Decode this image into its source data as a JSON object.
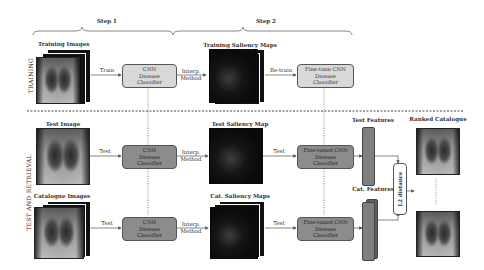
{
  "steps": {
    "step1": "Step 1",
    "step2": "Step 2"
  },
  "sections": {
    "training": "TRAINING",
    "test_retrieval": "TEST AND RETRIEVAL"
  },
  "training_row": {
    "images_label": "Training Images",
    "train_edge": "Train",
    "classifier": [
      "CNN",
      "Disease",
      "Classifier"
    ],
    "interp_edge": [
      "Interp.",
      "Method"
    ],
    "saliency_label": "Training Saliency Maps",
    "retrain_edge": "Re-train",
    "finetune": [
      "Fine-tune CNN",
      "Disease",
      "Classifier"
    ]
  },
  "test_row": {
    "image_label": "Test Image",
    "test_edge": "Test",
    "classifier": [
      "CNN",
      "Disease",
      "Classifier"
    ],
    "interp_edge": [
      "Interp.",
      "Method"
    ],
    "saliency_label": "Test Saliency Map",
    "test_edge2": "Test",
    "finetuned": [
      "Fine-tuned CNN",
      "Disease",
      "Classifier"
    ],
    "features_label": "Test Features"
  },
  "catalogue_row": {
    "images_label": "Catalogue Images",
    "test_edge": "Test",
    "classifier": [
      "CNN",
      "Disease",
      "Classifier"
    ],
    "interp_edge": [
      "Interp.",
      "Method"
    ],
    "saliency_label": "Cat. Saliency Maps",
    "test_edge2": "Test",
    "finetuned": [
      "Fine-tuned CNN",
      "Disease",
      "Classifier"
    ],
    "features_label": "Cat. Features"
  },
  "distance": "L2 distance",
  "ranked_label": "Ranked Catalogue",
  "colors": {
    "training_box": "#d9d9d9",
    "test_box": "#8c8c8c",
    "feature_bar": "#7f7f7f"
  }
}
